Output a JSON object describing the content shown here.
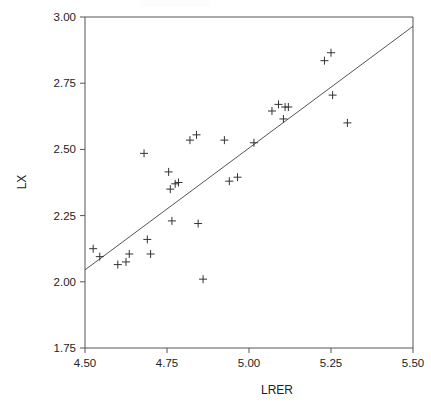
{
  "figure": {
    "width": 431,
    "height": 412,
    "background": "#ffffff",
    "marker_color": "#333333",
    "line_color": "#555555",
    "axis_color": "#555555"
  },
  "chart_data": {
    "type": "scatter",
    "title": "",
    "xlabel": "LRER",
    "ylabel": "LX",
    "xlim": [
      4.5,
      5.5
    ],
    "ylim": [
      1.75,
      3.0
    ],
    "xticks": [
      4.5,
      4.75,
      5.0,
      5.25,
      5.5
    ],
    "yticks": [
      1.75,
      2.0,
      2.25,
      2.5,
      2.75,
      3.0
    ],
    "xtick_labels": [
      "4.50",
      "4.75",
      "5.00",
      "5.25",
      "5.50"
    ],
    "ytick_labels": [
      "1.75",
      "2.00",
      "2.25",
      "2.50",
      "2.75",
      "3.00"
    ],
    "grid": false,
    "legend": false,
    "marker_symbol": "plus",
    "series": [
      {
        "name": "observations",
        "x": [
          4.525,
          4.545,
          4.6,
          4.625,
          4.635,
          4.68,
          4.69,
          4.7,
          4.755,
          4.76,
          4.765,
          4.775,
          4.785,
          4.82,
          4.84,
          4.845,
          4.86,
          4.925,
          4.94,
          4.965,
          5.015,
          5.07,
          5.09,
          5.105,
          5.11,
          5.12,
          5.23,
          5.25,
          5.255,
          5.3
        ],
        "y": [
          2.125,
          2.095,
          2.065,
          2.075,
          2.105,
          2.485,
          2.16,
          2.105,
          2.415,
          2.35,
          2.23,
          2.37,
          2.375,
          2.535,
          2.555,
          2.22,
          2.01,
          2.535,
          2.38,
          2.395,
          2.525,
          2.645,
          2.67,
          2.615,
          2.66,
          2.66,
          2.835,
          2.865,
          2.705,
          2.6
        ]
      }
    ],
    "fit_line": {
      "name": "regression-line",
      "x_start": 4.5,
      "y_start": 2.045,
      "x_end": 5.5,
      "y_end": 2.965
    }
  }
}
